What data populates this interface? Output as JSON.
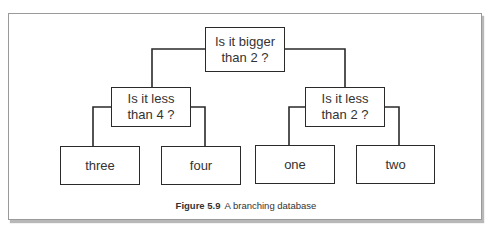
{
  "figure": {
    "caption_label": "Figure 5.9",
    "caption_text": "A branching database"
  },
  "tree": {
    "root": {
      "label": "Is it bigger\nthan 2 ?"
    },
    "left": {
      "label": "Is it less\nthan 4 ?"
    },
    "right": {
      "label": "Is it less\nthan 2 ?"
    },
    "leaves": [
      {
        "label": "three"
      },
      {
        "label": "four"
      },
      {
        "label": "one"
      },
      {
        "label": "two"
      }
    ]
  },
  "colors": {
    "line": "#2a2a2a",
    "frame": "#9a9a9a",
    "shadow": "#b8b8b8"
  }
}
